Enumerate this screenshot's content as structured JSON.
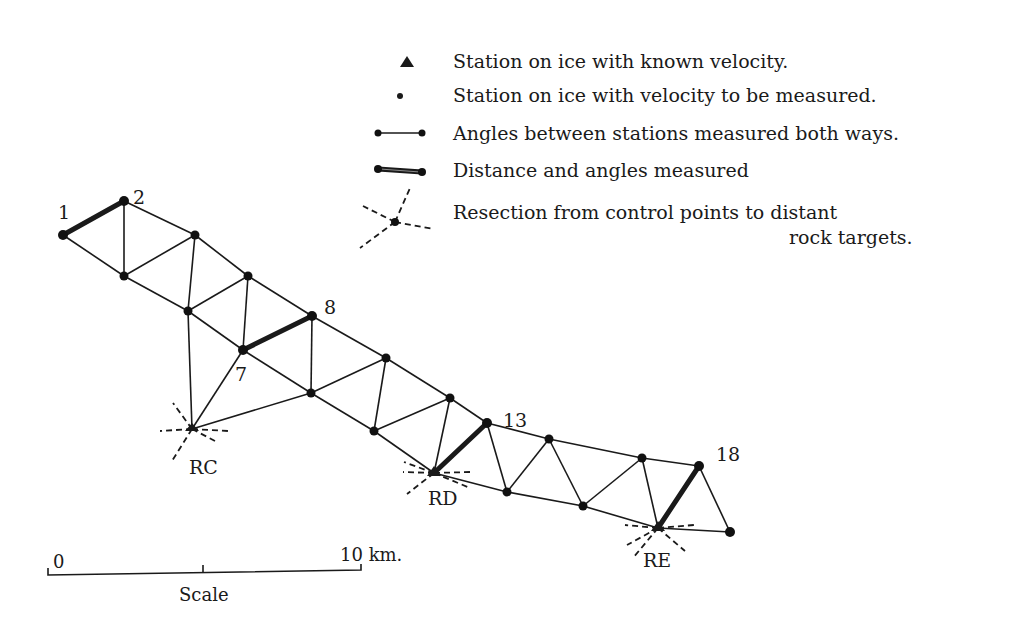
{
  "legend": {
    "items": [
      {
        "symbol": "triangle-station-icon",
        "label": "Station on ice with known velocity."
      },
      {
        "symbol": "dot-station-icon",
        "label": "Station on ice with velocity to be measured."
      },
      {
        "symbol": "thin-line-icon",
        "label": "Angles between stations measured both ways."
      },
      {
        "symbol": "thick-line-icon",
        "label": "Distance and angles measured"
      },
      {
        "symbol": "resection-icon",
        "label_line1": "Resection from control points to distant",
        "label_line2": "rock targets."
      }
    ]
  },
  "stations": {
    "labels": {
      "s1": "1",
      "s2": "2",
      "s7": "7",
      "s8": "8",
      "s13": "13",
      "s18": "18",
      "rc": "RC",
      "rd": "RD",
      "re": "RE"
    }
  },
  "scale": {
    "start_label": "0",
    "end_label": "10 km.",
    "caption": "Scale"
  },
  "colors": {
    "ink": "#1a1a1a",
    "background": "#ffffff"
  }
}
